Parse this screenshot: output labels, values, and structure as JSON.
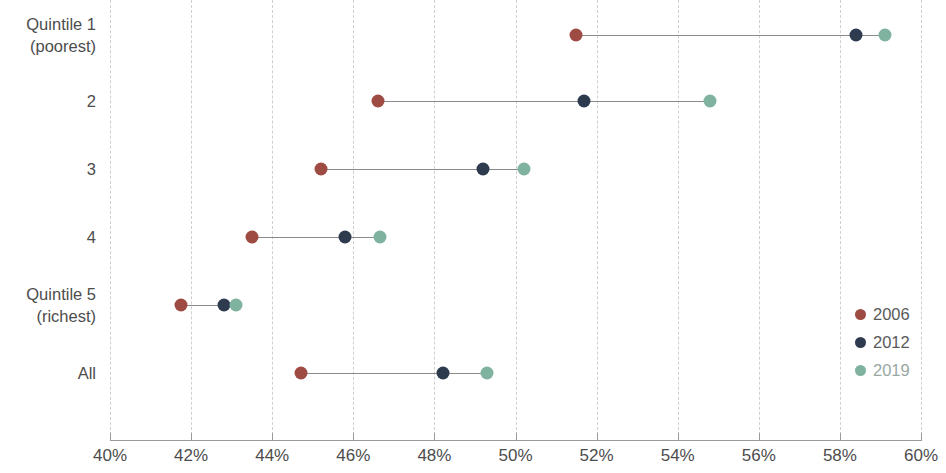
{
  "chart_data": {
    "type": "scatter",
    "subtype": "dumbbell",
    "title": "",
    "xlabel": "",
    "ylabel": "",
    "xlim": [
      40,
      60
    ],
    "xunit": "%",
    "grid": true,
    "legend_position": "bottom-right",
    "categories": [
      "Quintile 1\n(poorest)",
      "2",
      "3",
      "4",
      "Quintile 5\n(richest)",
      "All"
    ],
    "category_lines": [
      [
        "Quintile 1",
        "(poorest)"
      ],
      [
        "2"
      ],
      [
        "3"
      ],
      [
        "4"
      ],
      [
        "Quintile 5",
        "(richest)"
      ],
      [
        "All"
      ]
    ],
    "x_ticks": [
      40,
      42,
      44,
      46,
      48,
      50,
      52,
      54,
      56,
      58,
      60
    ],
    "x_tick_labels": [
      "40%",
      "42%",
      "44%",
      "46%",
      "48%",
      "50%",
      "52%",
      "54%",
      "56%",
      "58%",
      "60%"
    ],
    "series": [
      {
        "name": "2006",
        "color": "#9d4b43",
        "values": [
          51.5,
          46.6,
          45.2,
          43.5,
          41.75,
          44.7
        ]
      },
      {
        "name": "2012",
        "color": "#2e3b4e",
        "values": [
          58.4,
          51.7,
          49.2,
          45.8,
          42.8,
          48.2
        ]
      },
      {
        "name": "2019",
        "color": "#7fb3a0",
        "values": [
          59.1,
          54.8,
          50.2,
          46.65,
          43.1,
          49.3
        ]
      }
    ],
    "legend": [
      {
        "label": "2006",
        "color": "#9d4b43"
      },
      {
        "label": "2012",
        "color": "#2e3b4e"
      },
      {
        "label": "2019",
        "color": "#7fb3a0"
      }
    ]
  }
}
